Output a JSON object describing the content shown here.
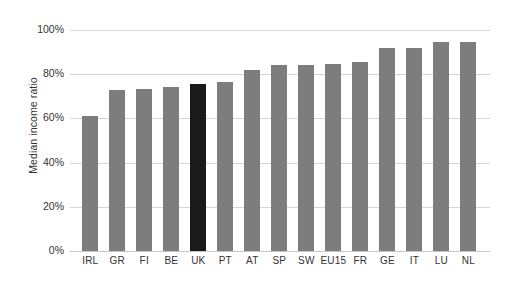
{
  "chart_data": {
    "type": "bar",
    "title": "",
    "xlabel": "",
    "ylabel": "Median income ratio",
    "ylim": [
      0,
      100
    ],
    "ytick_labels": [
      "0%",
      "20%",
      "40%",
      "60%",
      "80%",
      "100%"
    ],
    "ytick_values": [
      0,
      20,
      40,
      60,
      80,
      100
    ],
    "grid": true,
    "legend": "none",
    "value_suffix": "%",
    "categories": [
      "IRL",
      "GR",
      "FI",
      "BE",
      "UK",
      "PT",
      "AT",
      "SP",
      "SW",
      "EU15",
      "FR",
      "GE",
      "IT",
      "LU",
      "NL"
    ],
    "values": [
      61,
      73,
      73.5,
      74,
      75.5,
      76.5,
      82,
      84,
      84,
      84.5,
      85.5,
      92,
      92,
      94.5,
      94.5
    ],
    "highlight_category": "UK",
    "colors": {
      "bar": "#7d7d7d",
      "bar_highlight": "#1a1a1a",
      "gridline": "#d5d5d5",
      "axis": "#c6c6c6",
      "text": "#333333",
      "background": "#ffffff"
    }
  }
}
